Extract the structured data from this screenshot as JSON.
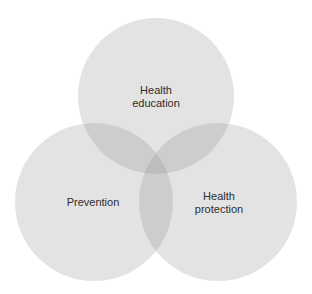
{
  "diagram": {
    "type": "venn",
    "sets": [
      {
        "id": "top",
        "lines": [
          "Health",
          "education"
        ],
        "cx": 156,
        "cy": 96,
        "r": 78
      },
      {
        "id": "left",
        "lines": [
          "Prevention"
        ],
        "cx": 94,
        "cy": 202,
        "r": 79
      },
      {
        "id": "right",
        "lines": [
          "Health",
          "protection"
        ],
        "cx": 218,
        "cy": 202,
        "r": 79
      }
    ],
    "colors": {
      "circle_fill": "#8a8a8a",
      "circle_opacity": 0.24,
      "text": "#2e2e2e",
      "background": "#ffffff"
    }
  }
}
